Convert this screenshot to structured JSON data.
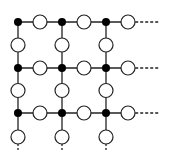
{
  "diagram": {
    "type": "lattice-grid",
    "colors": {
      "line": "#222222",
      "filled_node": "#000000",
      "open_node_fill": "#ffffff",
      "open_node_stroke": "#222222",
      "background": "#ffffff"
    },
    "grid": {
      "columns_x": [
        18,
        62,
        106
      ],
      "rows_y": [
        22,
        68,
        113
      ],
      "filled_node_radius": 4,
      "open_node_radius": 7,
      "dashed_extension_to_x": 160,
      "bottom_tail_to_y": 150
    }
  }
}
